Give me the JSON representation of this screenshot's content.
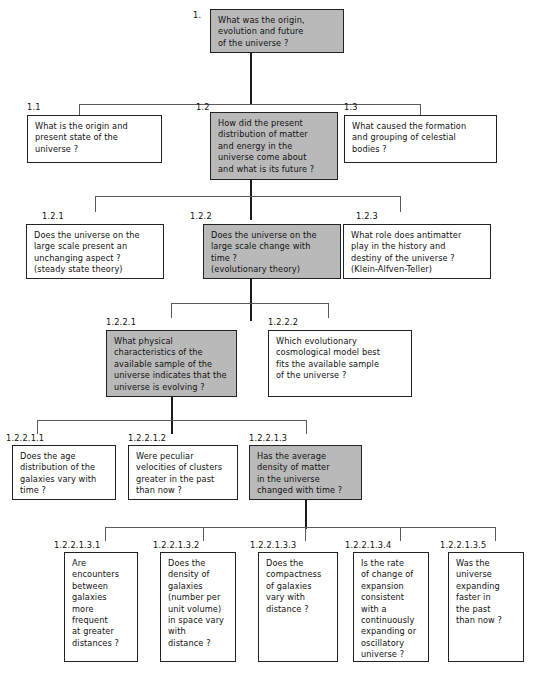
{
  "diagram": {
    "shade_color": "#b9b9b9",
    "line_color": "#1a1a1a",
    "nodes": [
      {
        "id": "n1",
        "number": "1.",
        "text": "What was the origin,\nevolution and future\nof the universe ?",
        "shaded": true
      },
      {
        "id": "n11",
        "number": "1.1",
        "text": "What is the origin and\npresent state of the\nuniverse ?",
        "shaded": false
      },
      {
        "id": "n12",
        "number": "1.2",
        "text": "How did the present\ndistribution of matter\nand energy in the\nuniverse come about\nand what is its future ?",
        "shaded": true
      },
      {
        "id": "n13",
        "number": "1.3",
        "text": "What caused the formation\nand grouping of celestial\nbodies ?",
        "shaded": false
      },
      {
        "id": "n121",
        "number": "1.2.1",
        "text": "Does the universe on the\nlarge scale present an\nunchanging aspect ?\n(steady state theory)",
        "shaded": false
      },
      {
        "id": "n122",
        "number": "1.2.2",
        "text": "Does the universe on the\nlarge scale change with\ntime ?\n(evolutionary theory)",
        "shaded": true
      },
      {
        "id": "n123",
        "number": "1.2.3",
        "text": "What role does antimatter\nplay in the history and\ndestiny of the universe ?\n(Klein-Alfven-Teller)",
        "shaded": false
      },
      {
        "id": "n1221",
        "number": "1.2.2.1",
        "text": "What physical\ncharacteristics of the\navailable sample of the\nuniverse indicates that the\nuniverse is evolving ?",
        "shaded": true
      },
      {
        "id": "n1222",
        "number": "1.2.2.2",
        "text": "Which evolutionary\ncosmological model best\nfits the available sample\nof the universe ?",
        "shaded": false
      },
      {
        "id": "n12211",
        "number": "1.2.2.1.1",
        "text": "Does the age\ndistribution of the\ngalaxies vary with\ntime ?",
        "shaded": false
      },
      {
        "id": "n12212",
        "number": "1.2.2.1.2",
        "text": "Were peculiar\nvelocities of clusters\ngreater in the past\nthan now ?",
        "shaded": false
      },
      {
        "id": "n12213",
        "number": "1.2.2.1.3",
        "text": "Has the average\ndensity of matter\nin the universe\nchanged with time ?",
        "shaded": true
      },
      {
        "id": "n122131",
        "number": "1.2.2.1.3.1",
        "text": "Are\nencounters\nbetween\ngalaxies\nmore\nfrequent\nat greater\ndistances ?",
        "shaded": false
      },
      {
        "id": "n122132",
        "number": "1.2.2.1.3.2",
        "text": "Does the\ndensity of\ngalaxies\n(number per\nunit volume)\nin space vary\nwith\ndistance ?",
        "shaded": false
      },
      {
        "id": "n122133",
        "number": "1.2.2.1.3.3",
        "text": "Does the\ncompactness\nof galaxies\nvary with\ndistance ?",
        "shaded": false
      },
      {
        "id": "n122134",
        "number": "1.2.2.1.3.4",
        "text": "Is the rate\nof change of\nexpansion\nconsistent\nwith a\ncontinuously\nexpanding or\noscillatory\nuniverse ?",
        "shaded": false
      },
      {
        "id": "n122135",
        "number": "1.2.2.1.3.5",
        "text": "Was the\nuniverse\nexpanding\nfaster in\nthe past\nthan now ?",
        "shaded": false
      }
    ]
  }
}
